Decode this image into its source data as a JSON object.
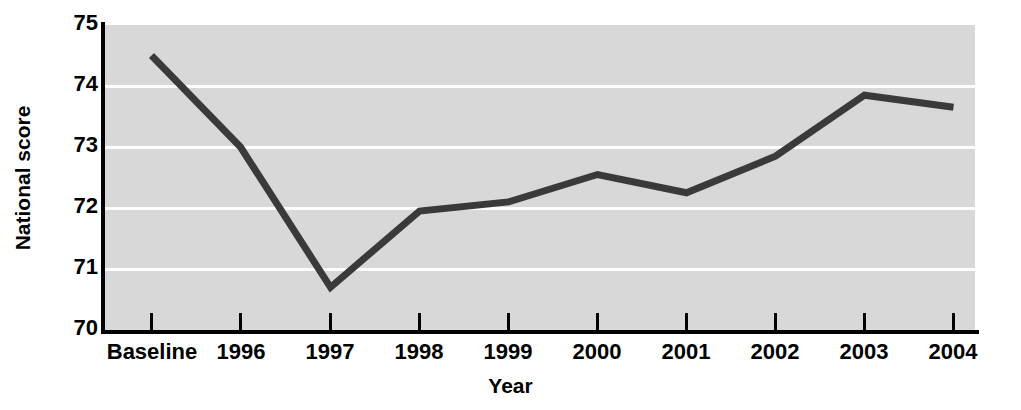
{
  "chart_data": {
    "type": "line",
    "title": "",
    "xlabel": "Year",
    "ylabel": "National score",
    "categories": [
      "Baseline",
      "1996",
      "1997",
      "1998",
      "1999",
      "2000",
      "2001",
      "2002",
      "2003",
      "2004"
    ],
    "values": [
      74.5,
      73.0,
      70.7,
      71.95,
      72.1,
      72.55,
      72.25,
      72.85,
      73.85,
      73.65
    ],
    "series": [
      {
        "name": "National score",
        "values": [
          74.5,
          73.0,
          70.7,
          71.95,
          72.1,
          72.55,
          72.25,
          72.85,
          73.85,
          73.65
        ]
      }
    ],
    "ylim": [
      70,
      75
    ],
    "yticks": [
      70,
      71,
      72,
      73,
      74,
      75
    ],
    "ytick_labels": [
      "70",
      "71",
      "72",
      "73",
      "74",
      "75"
    ],
    "grid": true,
    "grid_orientation": "horizontal",
    "legend": "none",
    "line_color": "#3a3a3a",
    "plot_background": "#d8d8d8",
    "gridline_color": "#fdfdfd",
    "axis_color": "#000000",
    "line_width": 7,
    "markers": false
  }
}
